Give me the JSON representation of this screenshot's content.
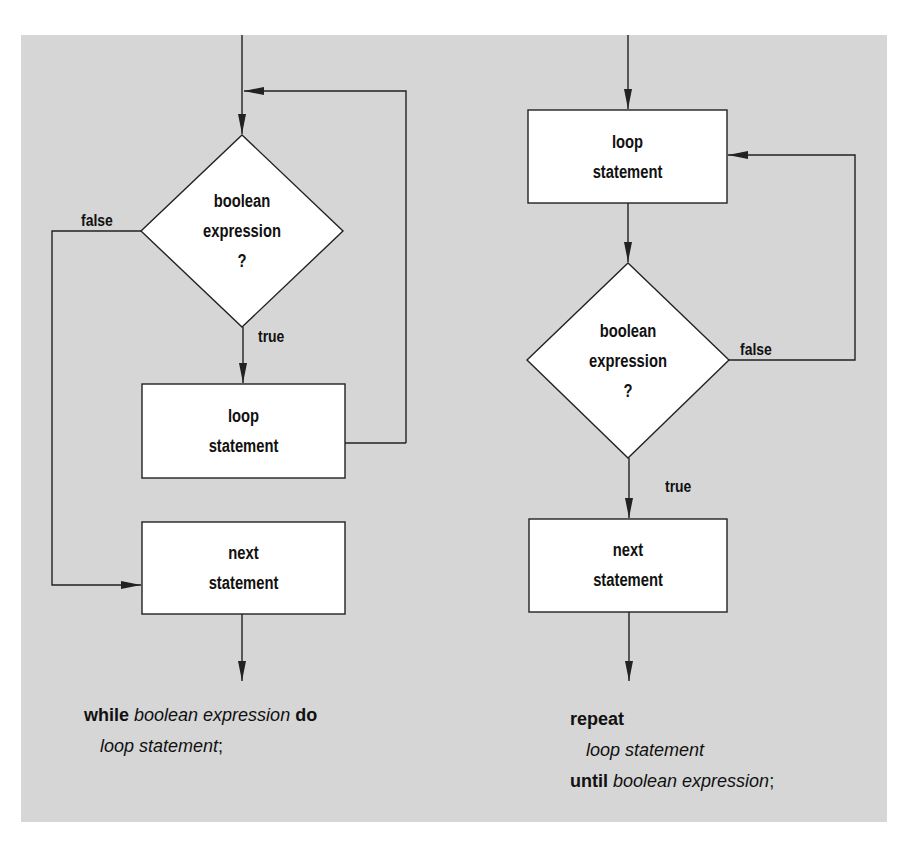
{
  "colors": {
    "background": "#d6d6d6",
    "node_fill": "#ffffff",
    "stroke": "#222222",
    "text": "#111111"
  },
  "while_loop": {
    "decision": {
      "line1": "boolean",
      "line2": "expression",
      "line3": "?"
    },
    "false_label": "false",
    "true_label": "true",
    "loop_box": {
      "line1": "loop",
      "line2": "statement"
    },
    "next_box": {
      "line1": "next",
      "line2": "statement"
    },
    "code": {
      "kw_while": "while",
      "cond": "boolean expression",
      "kw_do": "do",
      "body": "loop statement",
      "semicolon": ";"
    }
  },
  "repeat_loop": {
    "loop_box": {
      "line1": "loop",
      "line2": "statement"
    },
    "decision": {
      "line1": "boolean",
      "line2": "expression",
      "line3": "?"
    },
    "false_label": "false",
    "true_label": "true",
    "next_box": {
      "line1": "next",
      "line2": "statement"
    },
    "code": {
      "kw_repeat": "repeat",
      "body": "loop statement",
      "kw_until": "until",
      "cond": "boolean expression",
      "semicolon": ";"
    }
  }
}
